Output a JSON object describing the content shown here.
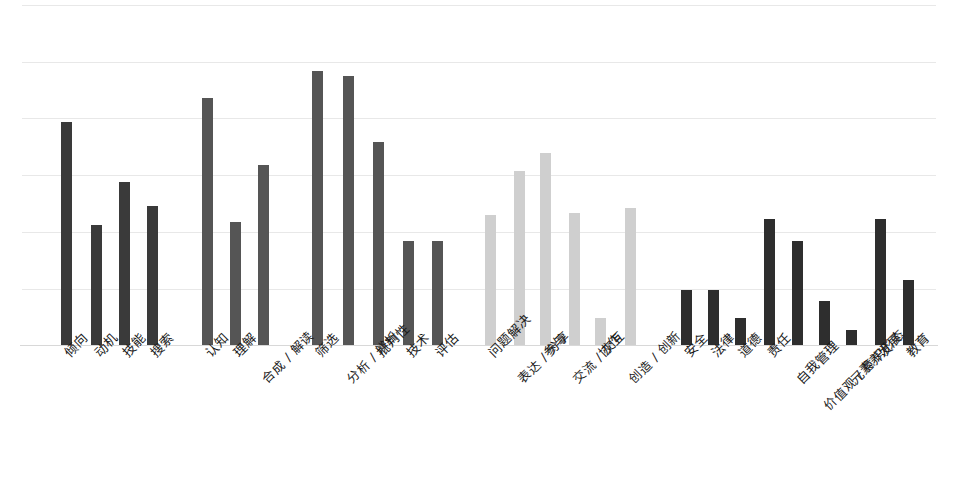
{
  "chart_data": {
    "type": "bar",
    "title": "",
    "subtitle": "",
    "xlabel": "",
    "ylabel": "",
    "grid": true,
    "legend": "none",
    "ylim": [
      0,
      6
    ],
    "y_gridline_values": [
      0,
      1,
      2,
      3,
      4,
      5,
      6
    ],
    "group_colors": {
      "dark": "#3a3a3a",
      "light": "#cfcfcf"
    },
    "groups": [
      {
        "name": "group-1",
        "color": "#3a3a3a",
        "categories": [
          "倾向",
          "动机",
          "技能",
          "搜索"
        ],
        "values": [
          3.9,
          2.1,
          2.9,
          2.45
        ]
      },
      {
        "name": "group-2",
        "color": "#555555",
        "categories": [
          "认知",
          "理解",
          "合成 / 解读"
        ],
        "values": [
          4.35,
          2.15,
          3.17
        ]
      },
      {
        "name": "group-3",
        "color": "#555555",
        "categories": [
          "筛选",
          "分析 / 辨析",
          "批判性",
          "技术",
          "评估"
        ],
        "values": [
          4.83,
          4.74,
          3.58,
          1.83,
          1.83
        ]
      },
      {
        "name": "group-4",
        "color": "#cfcfcf",
        "categories": [
          "问题解决",
          "表达 / 分享",
          "参与",
          "交流 / 交互",
          "协作",
          "创造 / 创新"
        ],
        "values": [
          2.28,
          3.05,
          3.37,
          2.32,
          0.47,
          2.4
        ]
      },
      {
        "name": "group-5",
        "color": "#2e2e2e",
        "categories": [
          "安全",
          "法律",
          "道德",
          "责任",
          "自我管理",
          "价值观 / 意识形态",
          "元素养",
          "发展",
          "教育"
        ],
        "values": [
          0.96,
          0.96,
          0.47,
          2.21,
          1.82,
          0.77,
          0.26,
          2.21,
          1.14
        ]
      }
    ],
    "bars": [
      {
        "label": "倾向",
        "x": 66,
        "top": 122,
        "color": "#3a3a3a",
        "value": 3.9,
        "label_offset": 0
      },
      {
        "label": "动机",
        "x": 96,
        "top": 225,
        "color": "#3a3a3a",
        "value": 2.1,
        "label_offset": 0
      },
      {
        "label": "技能",
        "x": 124,
        "top": 182,
        "color": "#3a3a3a",
        "value": 2.9,
        "label_offset": 0
      },
      {
        "label": "搜索",
        "x": 152,
        "top": 206,
        "color": "#3a3a3a",
        "value": 2.45,
        "label_offset": 0
      },
      {
        "label": "认知",
        "x": 207,
        "top": 98,
        "color": "#555555",
        "value": 4.35,
        "label_offset": 0
      },
      {
        "label": "理解",
        "x": 235,
        "top": 222,
        "color": "#555555",
        "value": 2.15,
        "label_offset": 0
      },
      {
        "label": "合成 / 解读",
        "x": 263,
        "top": 165,
        "color": "#555555",
        "value": 3.17,
        "label_offset": 1
      },
      {
        "label": "筛选",
        "x": 317,
        "top": 71,
        "color": "#555555",
        "value": 4.83,
        "label_offset": 0
      },
      {
        "label": "分析 / 辨析",
        "x": 348,
        "top": 76,
        "color": "#555555",
        "value": 4.74,
        "label_offset": 1
      },
      {
        "label": "批判性",
        "x": 378,
        "top": 142,
        "color": "#555555",
        "value": 3.58,
        "label_offset": 0
      },
      {
        "label": "技术",
        "x": 408,
        "top": 241,
        "color": "#555555",
        "value": 1.83,
        "label_offset": 0
      },
      {
        "label": "评估",
        "x": 437,
        "top": 241,
        "color": "#555555",
        "value": 1.83,
        "label_offset": 0
      },
      {
        "label": "问题解决",
        "x": 490,
        "top": 215,
        "color": "#cfcfcf",
        "value": 2.28,
        "label_offset": 0
      },
      {
        "label": "表达 / 分享",
        "x": 519,
        "top": 171,
        "color": "#cfcfcf",
        "value": 3.05,
        "label_offset": 1
      },
      {
        "label": "参与",
        "x": 545,
        "top": 153,
        "color": "#cfcfcf",
        "value": 3.37,
        "label_offset": 0
      },
      {
        "label": "交流 / 交互",
        "x": 574,
        "top": 213,
        "color": "#cfcfcf",
        "value": 2.32,
        "label_offset": 1
      },
      {
        "label": "协作",
        "x": 600,
        "top": 318,
        "color": "#cfcfcf",
        "value": 0.47,
        "label_offset": 0
      },
      {
        "label": "创造 / 创新",
        "x": 630,
        "top": 208,
        "color": "#cfcfcf",
        "value": 2.4,
        "label_offset": 1
      },
      {
        "label": "安全",
        "x": 686,
        "top": 290,
        "color": "#2e2e2e",
        "value": 0.96,
        "label_offset": 0
      },
      {
        "label": "法律",
        "x": 713,
        "top": 290,
        "color": "#2e2e2e",
        "value": 0.96,
        "label_offset": 0
      },
      {
        "label": "道德",
        "x": 740,
        "top": 318,
        "color": "#2e2e2e",
        "value": 0.47,
        "label_offset": 0
      },
      {
        "label": "责任",
        "x": 769,
        "top": 219,
        "color": "#2e2e2e",
        "value": 2.21,
        "label_offset": 0
      },
      {
        "label": "自我管理",
        "x": 797,
        "top": 241,
        "color": "#2e2e2e",
        "value": 1.82,
        "label_offset": 1
      },
      {
        "label": "价值观 / 意识形态",
        "x": 824,
        "top": 301,
        "color": "#2e2e2e",
        "value": 0.77,
        "label_offset": 2
      },
      {
        "label": "元素养",
        "x": 851,
        "top": 330,
        "color": "#2e2e2e",
        "value": 0.26,
        "label_offset": 1
      },
      {
        "label": "发展",
        "x": 880,
        "top": 219,
        "color": "#2e2e2e",
        "value": 2.21,
        "label_offset": 0
      },
      {
        "label": "教育",
        "x": 908,
        "top": 280,
        "color": "#2e2e2e",
        "value": 1.14,
        "label_offset": 0
      }
    ],
    "gridlines_y": [
      5,
      62,
      118,
      175,
      232,
      289,
      345
    ]
  }
}
